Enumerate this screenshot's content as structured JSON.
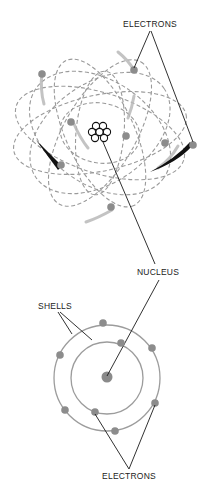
{
  "diagram": {
    "top_model": {
      "label_electrons": "ELECTRONS",
      "nucleus_protons": 7,
      "electrons_count": 7
    },
    "shared": {
      "label_nucleus": "NUCLEUS"
    },
    "bottom_model": {
      "label_shells": "SHELLS",
      "label_electrons": "ELECTRONS",
      "shells_count": 2,
      "electrons_count": 8
    },
    "colors": {
      "orbit": "#9a9a9a",
      "electron": "#8c8c8c",
      "leader_line": "#1a1a1a",
      "label": "#222222"
    }
  }
}
